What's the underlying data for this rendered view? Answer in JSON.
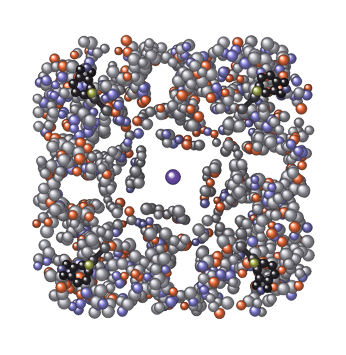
{
  "image": {
    "kind": "molecular-structure-render",
    "subject": "C4-symmetric macromolecular complex, ball-and-stick representation",
    "width": 346,
    "height": 355,
    "background_color": "#ffffff",
    "symmetry": "four-fold rotational (C4) about image center",
    "center_point": [
      173,
      177
    ],
    "outer_radius": 168,
    "core_radius": 30,
    "alt_text": "Ball-and-stick rendering of a four-fold symmetric protein complex with gray carbon, orange oxygen and blue-violet nitrogen atoms, dark aromatic rings at the four corners, and a single violet ion at the center."
  },
  "palette": {
    "background": "#ffffff",
    "carbon_light": "#9a9aa2",
    "carbon_mid": "#7e7e88",
    "carbon_dark": "#5b5b64",
    "carbon_shadow": "#3a3a42",
    "aromatic_dark": "#2e2b30",
    "aromatic_darker": "#222024",
    "oxygen": "#e2683c",
    "oxygen_light": "#f08a5a",
    "nitrogen": "#7b77c4",
    "nitrogen_light": "#9a96d8",
    "sulfur": "#b8bf5a",
    "central_ion": "#6b4fa8",
    "central_ion_rim": "#4e3780",
    "bond": "#4a4a52",
    "bond_dark": "#2c2a2e",
    "highlight": "#ffffff"
  },
  "legend": {
    "atoms": [
      {
        "element": "C",
        "name": "carbon",
        "color": "#8b8b94",
        "radius": 5.2
      },
      {
        "element": "O",
        "name": "oxygen",
        "color": "#e2683c",
        "radius": 4.4
      },
      {
        "element": "N",
        "name": "nitrogen",
        "color": "#7b77c4",
        "radius": 4.6
      },
      {
        "element": "S",
        "name": "sulfur",
        "color": "#b8bf5a",
        "radius": 4.8
      }
    ],
    "ion": {
      "element": "Na",
      "name": "central ion",
      "color": "#6b4fa8",
      "radius": 7.5
    }
  },
  "composition": {
    "atom_count_approx": 2400,
    "element_fractions": {
      "carbon": 0.62,
      "nitrogen": 0.18,
      "oxygen": 0.18,
      "sulfur": 0.02
    },
    "rings_per_quadrant": 1,
    "total_corner_rings": 4
  },
  "chart_data": {
    "type": "scatter",
    "title": "",
    "xlabel": "",
    "ylabel": "",
    "xlim": [
      0,
      346
    ],
    "ylim": [
      0,
      355
    ],
    "grid": false,
    "legend": "none",
    "seed": 20240517,
    "series": [
      {
        "name": "carbon",
        "color": "#8b8b94",
        "count": 1450,
        "radius": 5.2
      },
      {
        "name": "nitrogen",
        "color": "#7b77c4",
        "count": 430,
        "radius": 4.6
      },
      {
        "name": "oxygen",
        "color": "#e2683c",
        "count": 430,
        "radius": 4.4
      },
      {
        "name": "sulfur",
        "color": "#b8bf5a",
        "count": 4,
        "radius": 4.8
      },
      {
        "name": "central-ion",
        "color": "#6b4fa8",
        "count": 1,
        "radius": 7.5,
        "points": [
          [
            173,
            177
          ]
        ]
      }
    ],
    "corner_rings": [
      {
        "quadrant": "top-left",
        "center": [
          82,
          86
        ],
        "angle_deg": 225,
        "type": "bicyclic-indole"
      },
      {
        "quadrant": "top-right",
        "center": [
          268,
          84
        ],
        "angle_deg": 315,
        "type": "bicyclic-indole"
      },
      {
        "quadrant": "bottom-right",
        "center": [
          266,
          272
        ],
        "angle_deg": 45,
        "type": "bicyclic-indole"
      },
      {
        "quadrant": "bottom-left",
        "center": [
          80,
          274
        ],
        "angle_deg": 135,
        "type": "bicyclic-indole"
      }
    ],
    "sulfur_points": [
      [
        92,
        93
      ],
      [
        257,
        91
      ],
      [
        254,
        263
      ],
      [
        89,
        265
      ]
    ],
    "lobe_centers": [
      [
        173,
        60
      ],
      [
        286,
        177
      ],
      [
        173,
        294
      ],
      [
        60,
        177
      ]
    ],
    "notch_directions_deg": [
      45,
      135,
      225,
      315
    ]
  }
}
